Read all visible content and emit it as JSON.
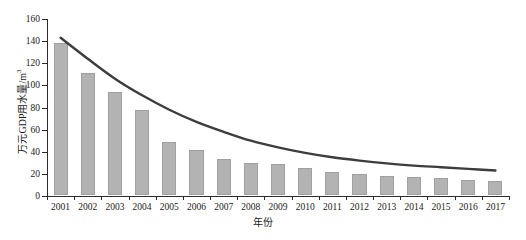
{
  "chart_data": {
    "type": "bar",
    "title": "",
    "xlabel": "年份",
    "ylabel": "万元GDP用水量/m",
    "ylabel_superscript": "3",
    "categories": [
      "2001",
      "2002",
      "2003",
      "2004",
      "2005",
      "2006",
      "2007",
      "2008",
      "2009",
      "2010",
      "2011",
      "2012",
      "2013",
      "2014",
      "2015",
      "2016",
      "2017"
    ],
    "values": [
      137,
      110,
      93,
      77,
      48,
      41,
      33,
      29,
      28,
      24,
      21,
      19,
      17,
      16,
      15,
      14,
      13
    ],
    "ylim": [
      0,
      160
    ],
    "yticks": [
      0,
      20,
      40,
      60,
      80,
      100,
      120,
      140,
      160
    ],
    "ytick_labels": [
      "0",
      "20",
      "40",
      "60",
      "80",
      "100",
      "120",
      "140",
      "160"
    ],
    "grid": false,
    "legend": "none",
    "series": [
      {
        "name": "万元GDP用水量",
        "kind": "bar",
        "color": "#b3b3b3",
        "values": [
          137,
          110,
          93,
          77,
          48,
          41,
          33,
          29,
          28,
          24,
          21,
          19,
          17,
          16,
          15,
          14,
          13
        ]
      },
      {
        "name": "趋势线",
        "kind": "line",
        "color": "#3d3d3d",
        "values": [
          143,
          124,
          106,
          91,
          78,
          67,
          58,
          50,
          44,
          39,
          35,
          32,
          29.5,
          27.5,
          26,
          24.5,
          23
        ]
      }
    ],
    "bar_color": "#b3b3b3",
    "line_color": "#3d3d3d",
    "axis_color": "#2b2b2b",
    "background": "#ffffff"
  }
}
